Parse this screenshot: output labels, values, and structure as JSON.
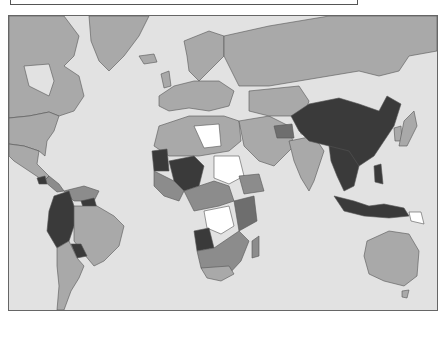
{
  "map": {
    "type": "choropleth",
    "projection": "mercator",
    "caption": "",
    "colors": {
      "ocean": "#e2e2e2",
      "class_light": "#a9a9a9",
      "class_mid": "#8c8c8c",
      "class_dark": "#6e6e6e",
      "class_darkest": "#3a3a3a",
      "class_white": "#ffffff"
    },
    "highlighted_darkest": [
      "China",
      "Mongolia",
      "Southeast Asia",
      "Indonesia",
      "Mali",
      "Niger",
      "Nigeria",
      "Peru",
      "Colombia",
      "Angola",
      "Bolivia",
      "Paraguay",
      "Mauritania"
    ],
    "highlighted_white": [
      "Libya",
      "Sudan",
      "Democratic Republic of the Congo",
      "Papua New Guinea",
      "Kashmir"
    ]
  }
}
